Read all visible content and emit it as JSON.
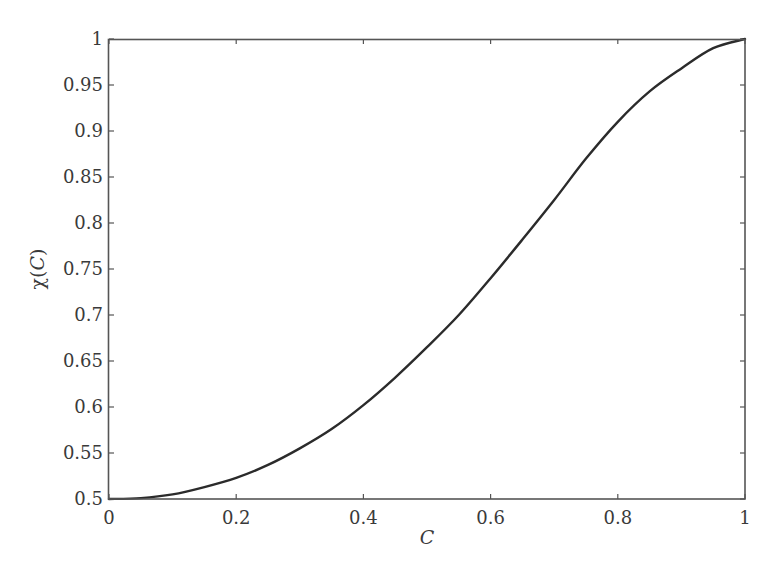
{
  "chart_data": {
    "type": "line",
    "title": "",
    "xlabel": "C",
    "ylabel": "χ(C)",
    "xlim": [
      0,
      1
    ],
    "ylim": [
      0.5,
      1
    ],
    "grid": false,
    "legend": null,
    "xticks": [
      "0",
      "0.2",
      "0.4",
      "0.6",
      "0.8",
      "1"
    ],
    "yticks": [
      "0.5",
      "0.55",
      "0.6",
      "0.65",
      "0.7",
      "0.75",
      "0.8",
      "0.85",
      "0.9",
      "0.95",
      "1"
    ],
    "series": [
      {
        "name": "χ(C)",
        "color": "#2b2b2b",
        "x": [
          0,
          0.05,
          0.1,
          0.15,
          0.2,
          0.25,
          0.3,
          0.35,
          0.4,
          0.45,
          0.5,
          0.55,
          0.6,
          0.65,
          0.7,
          0.75,
          0.8,
          0.85,
          0.9,
          0.95,
          1.0
        ],
        "y": [
          0.5,
          0.501,
          0.505,
          0.513,
          0.523,
          0.537,
          0.555,
          0.576,
          0.602,
          0.632,
          0.665,
          0.7,
          0.74,
          0.782,
          0.825,
          0.87,
          0.91,
          0.943,
          0.968,
          0.99,
          1.0
        ]
      }
    ]
  },
  "labels": {
    "xlabel": "C",
    "ylabel_prefix": "χ(",
    "ylabel_var": "C",
    "ylabel_suffix": ")"
  }
}
